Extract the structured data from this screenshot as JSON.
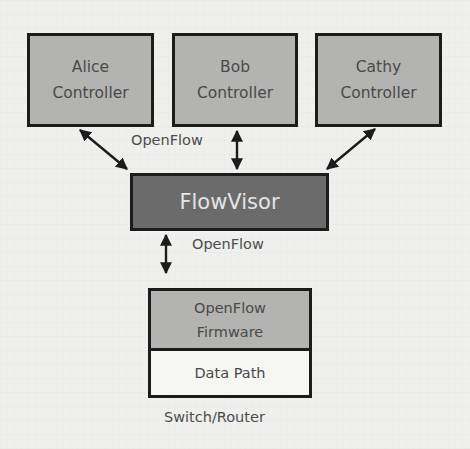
{
  "diagram": {
    "controllers": [
      {
        "line1": "Alice",
        "line2": "Controller"
      },
      {
        "line1": "Bob",
        "line2": "Controller"
      },
      {
        "line1": "Cathy",
        "line2": "Controller"
      }
    ],
    "hypervisor": {
      "label": "FlowVisor"
    },
    "upper_protocol_label": "OpenFlow",
    "lower_protocol_label": "OpenFlow",
    "switch": {
      "firmware_line1": "OpenFlow",
      "firmware_line2": "Firmware",
      "datapath_label": "Data Path",
      "caption": "Switch/Router"
    },
    "colors": {
      "controller_fill": "#b3b3b1",
      "flowvisor_fill": "#6b6b6b",
      "datapath_fill": "#f6f6f4",
      "border": "#1c1c1c"
    }
  }
}
